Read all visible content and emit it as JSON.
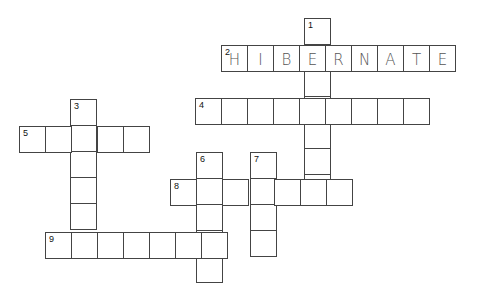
{
  "puzzle": {
    "type": "crossword",
    "cell_size": 26,
    "entries": [
      {
        "number": "1",
        "direction": "down",
        "x": 304,
        "y": 18,
        "length": 7,
        "answer": ""
      },
      {
        "number": "2",
        "direction": "across",
        "x": 221,
        "y": 45,
        "length": 9,
        "answer": "HIBERNATE"
      },
      {
        "number": "3",
        "direction": "down",
        "x": 70,
        "y": 99,
        "length": 5,
        "answer": ""
      },
      {
        "number": "4",
        "direction": "across",
        "x": 195,
        "y": 98,
        "length": 9,
        "answer": ""
      },
      {
        "number": "5",
        "direction": "across",
        "x": 19,
        "y": 126,
        "length": 5,
        "answer": ""
      },
      {
        "number": "6",
        "direction": "down",
        "x": 196,
        "y": 152,
        "length": 5,
        "answer": ""
      },
      {
        "number": "7",
        "direction": "down",
        "x": 250,
        "y": 152,
        "length": 4,
        "answer": ""
      },
      {
        "number": "8",
        "direction": "across",
        "x": 170,
        "y": 179,
        "length": 7,
        "answer": ""
      },
      {
        "number": "9",
        "direction": "across",
        "x": 45,
        "y": 232,
        "length": 7,
        "answer": ""
      }
    ]
  }
}
